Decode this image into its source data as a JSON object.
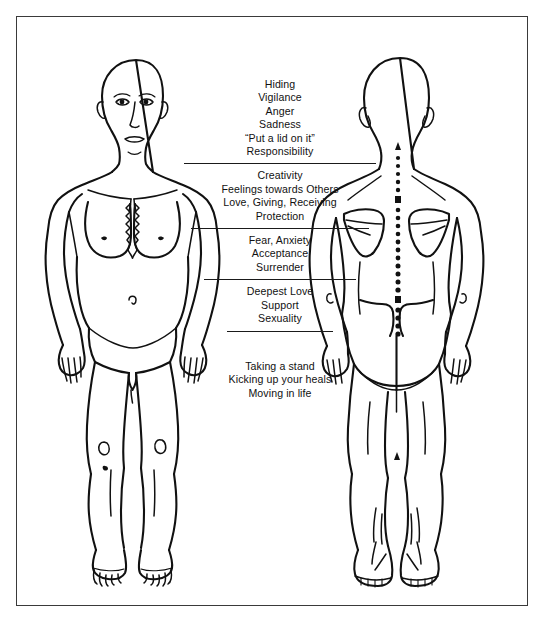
{
  "diagram": {
    "background_color": "#ffffff",
    "ink_color": "#111111",
    "frame_color": "#3a3a3a",
    "figures": [
      {
        "name": "front-view-figure",
        "view": "front"
      },
      {
        "name": "back-view-figure",
        "view": "back"
      }
    ]
  },
  "text_groups": [
    {
      "id": "group-head-chest",
      "region": "head-and-upper-chest",
      "lines": [
        "Hiding",
        "Vigilance",
        "Anger",
        "Sadness",
        "“Put a lid on it”",
        "Responsibility"
      ]
    },
    {
      "id": "group-heart",
      "region": "heart-and-chest",
      "lines": [
        "Creativity",
        "Feelings towards Others",
        "Love, Giving, Receiving",
        "Protection"
      ]
    },
    {
      "id": "group-solar-plexus",
      "region": "solar-plexus-abdomen",
      "lines": [
        "Fear, Anxiety",
        "Acceptance",
        "Surrender"
      ]
    },
    {
      "id": "group-pelvis",
      "region": "pelvis-lower-abdomen",
      "lines": [
        "Deepest Love",
        "Support",
        "Sexuality"
      ]
    },
    {
      "id": "group-legs",
      "region": "legs-and-feet",
      "lines": [
        "Taking a stand",
        "Kicking up your heals",
        "Moving in life"
      ]
    }
  ]
}
